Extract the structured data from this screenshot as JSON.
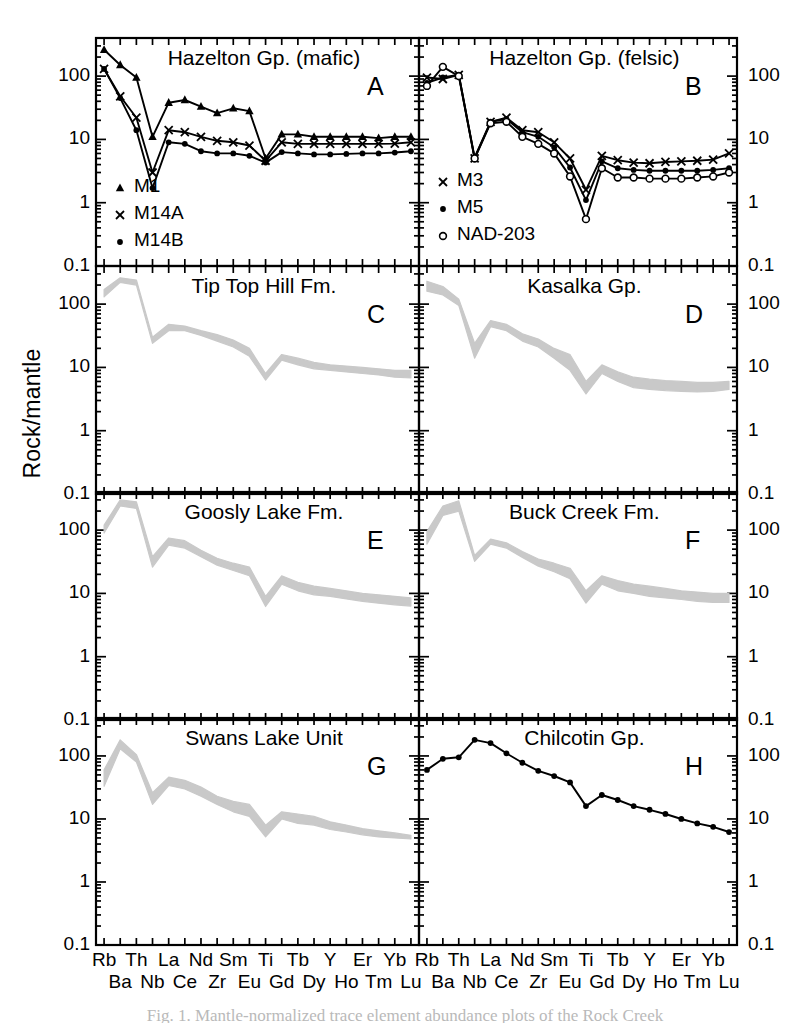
{
  "figure": {
    "ylabel": "Rock/mantle",
    "caption": "Fig. 1. Mantle-normalized trace element abundance plots of the Rock Creek",
    "band_color": "#c9c9c9",
    "line_color": "#000000",
    "axis_color": "#000000"
  },
  "axes": {
    "y_ticks": [
      "0.1",
      "1",
      "10",
      "100"
    ],
    "y_values": [
      0.1,
      1,
      10,
      100
    ],
    "y_min": 0.1,
    "y_max": 400,
    "x_top_row": [
      "Rb",
      "Th",
      "La",
      "Nd",
      "Hf",
      "Eu",
      "Gd",
      "Dy",
      "Ho",
      "Tm",
      "Lu"
    ],
    "x_bottom_row": [
      "Ba",
      "Nb",
      "Ce",
      "Zr",
      "Sm",
      "Ti",
      "Tb",
      "Y",
      "Er",
      "Yb"
    ],
    "x_elements": [
      "Rb",
      "Ba",
      "Th",
      "Nb",
      "La",
      "Ce",
      "Nd",
      "Zr",
      "Sm",
      "Eu",
      "Ti",
      "Gd",
      "Tb",
      "Dy",
      "Y",
      "Ho",
      "Er",
      "Tm",
      "Yb",
      "Lu"
    ]
  },
  "chart_data": [
    {
      "panel": "A",
      "type": "line",
      "title": "Hazelton Gp. (mafic)",
      "xlabel": "",
      "ylabel": "Rock/mantle",
      "yscale": "log",
      "ylim": [
        0.1,
        400
      ],
      "grid": false,
      "legend_position": "bottom-left",
      "categories": [
        "Rb",
        "Ba",
        "Th",
        "Nb",
        "La",
        "Ce",
        "Nd",
        "Zr",
        "Sm",
        "Eu",
        "Ti",
        "Gd",
        "Tb",
        "Dy",
        "Y",
        "Ho",
        "Er",
        "Tm",
        "Yb",
        "Lu"
      ],
      "series": [
        {
          "name": "M1",
          "marker": "triangle",
          "values": [
            260,
            150,
            95,
            11,
            38,
            42,
            33,
            26,
            31,
            28,
            5.0,
            12,
            12,
            11,
            11,
            11,
            11,
            10.5,
            11,
            11
          ]
        },
        {
          "name": "M14A",
          "marker": "cross",
          "values": [
            130,
            48,
            22,
            3.0,
            14,
            13,
            11,
            9.5,
            9.0,
            8.0,
            4.6,
            9.0,
            8.5,
            8.5,
            8.5,
            8.5,
            8.5,
            8.5,
            8.6,
            9.0
          ]
        },
        {
          "name": "M14B",
          "marker": "dot",
          "values": [
            130,
            45,
            14,
            1.7,
            9.0,
            8.5,
            6.5,
            6.0,
            6.0,
            5.5,
            4.3,
            6.3,
            6.0,
            5.8,
            5.8,
            5.9,
            6.0,
            6.0,
            6.2,
            6.5
          ]
        }
      ]
    },
    {
      "panel": "B",
      "type": "line",
      "title": "Hazelton Gp. (felsic)",
      "xlabel": "",
      "ylabel": "Rock/mantle",
      "yscale": "log",
      "ylim": [
        0.1,
        400
      ],
      "grid": false,
      "legend_position": "mid-left",
      "categories": [
        "Rb",
        "Ba",
        "Th",
        "Nb",
        "La",
        "Ce",
        "Nd",
        "Zr",
        "Sm",
        "Eu",
        "Ti",
        "Gd",
        "Tb",
        "Dy",
        "Y",
        "Ho",
        "Er",
        "Tm",
        "Yb",
        "Lu"
      ],
      "series": [
        {
          "name": "M3",
          "marker": "cross",
          "values": [
            95,
            90,
            105,
            5.0,
            19,
            22,
            14,
            13,
            9.0,
            5.0,
            1.6,
            5.5,
            4.7,
            4.3,
            4.2,
            4.4,
            4.5,
            4.6,
            4.8,
            6.0
          ]
        },
        {
          "name": "M5",
          "marker": "dot",
          "values": [
            78,
            95,
            105,
            5.2,
            19,
            21,
            13,
            11,
            7.5,
            3.6,
            1.1,
            4.5,
            3.5,
            3.3,
            3.2,
            3.2,
            3.2,
            3.2,
            3.3,
            3.5
          ]
        },
        {
          "name": "NAD-203",
          "marker": "circle",
          "values": [
            70,
            140,
            100,
            5.0,
            18,
            19,
            11,
            8.5,
            6.0,
            2.6,
            0.55,
            3.5,
            2.5,
            2.5,
            2.4,
            2.4,
            2.4,
            2.5,
            2.6,
            3.0
          ]
        }
      ]
    },
    {
      "panel": "C",
      "type": "area",
      "title": "Tip Top Hill Fm.",
      "yscale": "log",
      "ylim": [
        0.1,
        400
      ],
      "grid": false,
      "categories": [
        "Rb",
        "Ba",
        "Th",
        "Nb",
        "La",
        "Ce",
        "Nd",
        "Zr",
        "Sm",
        "Eu",
        "Ti",
        "Gd",
        "Tb",
        "Dy",
        "Y",
        "Ho",
        "Er",
        "Tm",
        "Yb",
        "Lu"
      ],
      "band_upper": [
        170,
        260,
        240,
        30,
        48,
        45,
        38,
        33,
        27,
        20,
        8.0,
        16,
        14,
        12,
        11,
        10.5,
        10,
        9.5,
        9.0,
        9.0
      ],
      "band_lower": [
        130,
        220,
        200,
        24,
        38,
        38,
        32,
        26,
        21,
        15,
        6.3,
        13,
        11,
        9.5,
        9.0,
        8.5,
        8.0,
        7.6,
        7.0,
        6.8
      ]
    },
    {
      "panel": "D",
      "type": "area",
      "title": "Kasalka Gp.",
      "yscale": "log",
      "ylim": [
        0.1,
        400
      ],
      "grid": false,
      "categories": [
        "Rb",
        "Ba",
        "Th",
        "Nb",
        "La",
        "Ce",
        "Nd",
        "Zr",
        "Sm",
        "Eu",
        "Ti",
        "Gd",
        "Tb",
        "Dy",
        "Y",
        "Ho",
        "Er",
        "Tm",
        "Yb",
        "Lu"
      ],
      "band_upper": [
        230,
        190,
        120,
        24,
        55,
        48,
        34,
        28,
        20,
        16,
        6.0,
        11,
        8.5,
        7.0,
        6.5,
        6.2,
        6.0,
        5.8,
        5.8,
        6.0
      ],
      "band_lower": [
        160,
        140,
        95,
        14,
        44,
        38,
        26,
        21,
        14,
        9.0,
        3.8,
        8.0,
        6.0,
        4.8,
        4.5,
        4.3,
        4.2,
        4.1,
        4.2,
        4.5
      ]
    },
    {
      "panel": "E",
      "type": "area",
      "title": "Goosly Lake Fm.",
      "yscale": "log",
      "ylim": [
        0.1,
        400
      ],
      "grid": false,
      "categories": [
        "Rb",
        "Ba",
        "Th",
        "Nb",
        "La",
        "Ce",
        "Nd",
        "Zr",
        "Sm",
        "Eu",
        "Ti",
        "Gd",
        "Tb",
        "Dy",
        "Y",
        "Ho",
        "Er",
        "Tm",
        "Yb",
        "Lu"
      ],
      "band_upper": [
        120,
        300,
        280,
        38,
        75,
        68,
        48,
        36,
        30,
        26,
        9.0,
        19,
        15,
        13,
        12,
        11,
        10,
        9.5,
        9.0,
        8.5
      ],
      "band_lower": [
        90,
        240,
        220,
        26,
        58,
        52,
        38,
        28,
        23,
        19,
        6.2,
        14,
        11,
        9.5,
        9.0,
        8.2,
        7.5,
        7.0,
        6.6,
        6.3
      ]
    },
    {
      "panel": "F",
      "type": "area",
      "title": "Buck Creek Fm.",
      "yscale": "log",
      "ylim": [
        0.1,
        400
      ],
      "grid": false,
      "categories": [
        "Rb",
        "Ba",
        "Th",
        "Nb",
        "La",
        "Ce",
        "Nd",
        "Zr",
        "Sm",
        "Eu",
        "Ti",
        "Gd",
        "Tb",
        "Dy",
        "Y",
        "Ho",
        "Er",
        "Tm",
        "Yb",
        "Lu"
      ],
      "band_upper": [
        95,
        240,
        290,
        40,
        72,
        63,
        46,
        35,
        30,
        25,
        11,
        19,
        16,
        14,
        13,
        12,
        11,
        10.5,
        10,
        10
      ],
      "band_lower": [
        60,
        170,
        200,
        32,
        60,
        52,
        37,
        27,
        22,
        17,
        7.0,
        14,
        11,
        10,
        9.0,
        8.5,
        8.0,
        7.5,
        7.2,
        7.2
      ]
    },
    {
      "panel": "G",
      "type": "area",
      "title": "Swans Lake Unit",
      "yscale": "log",
      "ylim": [
        0.1,
        400
      ],
      "grid": false,
      "categories": [
        "Rb",
        "Ba",
        "Th",
        "Nb",
        "La",
        "Ce",
        "Nd",
        "Zr",
        "Sm",
        "Eu",
        "Ti",
        "Gd",
        "Tb",
        "Dy",
        "Y",
        "Ho",
        "Er",
        "Tm",
        "Yb",
        "Lu"
      ],
      "band_upper": [
        60,
        180,
        105,
        26,
        46,
        41,
        32,
        23,
        19,
        17,
        8.0,
        13,
        12,
        11,
        9.0,
        8.0,
        7.0,
        6.5,
        6.0,
        5.5
      ],
      "band_lower": [
        33,
        130,
        80,
        17,
        34,
        30,
        23,
        17,
        13,
        11,
        5.2,
        10,
        8.5,
        8.0,
        6.8,
        6.2,
        5.6,
        5.2,
        5.0,
        4.8
      ]
    },
    {
      "panel": "H",
      "type": "line",
      "title": "Chilcotin Gp.",
      "yscale": "log",
      "ylim": [
        0.1,
        400
      ],
      "grid": false,
      "categories": [
        "Rb",
        "Ba",
        "Th",
        "Nb",
        "La",
        "Ce",
        "Nd",
        "Zr",
        "Sm",
        "Eu",
        "Ti",
        "Gd",
        "Tb",
        "Dy",
        "Y",
        "Ho",
        "Er",
        "Tm",
        "Yb",
        "Lu"
      ],
      "series": [
        {
          "name": "Chilcotin Gp.",
          "marker": "dot",
          "values": [
            60,
            90,
            95,
            180,
            160,
            110,
            78,
            58,
            48,
            38,
            16,
            24,
            20,
            16,
            14,
            12,
            10,
            8.5,
            7.5,
            6.2
          ]
        }
      ]
    }
  ],
  "panels": [
    {
      "id": "A",
      "title": "Hazelton Gp. (mafic)",
      "letter": "A"
    },
    {
      "id": "B",
      "title": "Hazelton Gp. (felsic)",
      "letter": "B"
    },
    {
      "id": "C",
      "title": "Tip Top Hill Fm.",
      "letter": "C"
    },
    {
      "id": "D",
      "title": "Kasalka Gp.",
      "letter": "D"
    },
    {
      "id": "E",
      "title": "Goosly Lake Fm.",
      "letter": "E"
    },
    {
      "id": "F",
      "title": "Buck Creek Fm.",
      "letter": "F"
    },
    {
      "id": "G",
      "title": "Swans Lake Unit",
      "letter": "G"
    },
    {
      "id": "H",
      "title": "Chilcotin Gp.",
      "letter": "H"
    }
  ],
  "legends": {
    "A": [
      {
        "label": "M1",
        "marker": "triangle"
      },
      {
        "label": "M14A",
        "marker": "cross"
      },
      {
        "label": "M14B",
        "marker": "dot"
      }
    ],
    "B": [
      {
        "label": "M3",
        "marker": "cross"
      },
      {
        "label": "M5",
        "marker": "dot"
      },
      {
        "label": "NAD-203",
        "marker": "circle"
      }
    ]
  }
}
